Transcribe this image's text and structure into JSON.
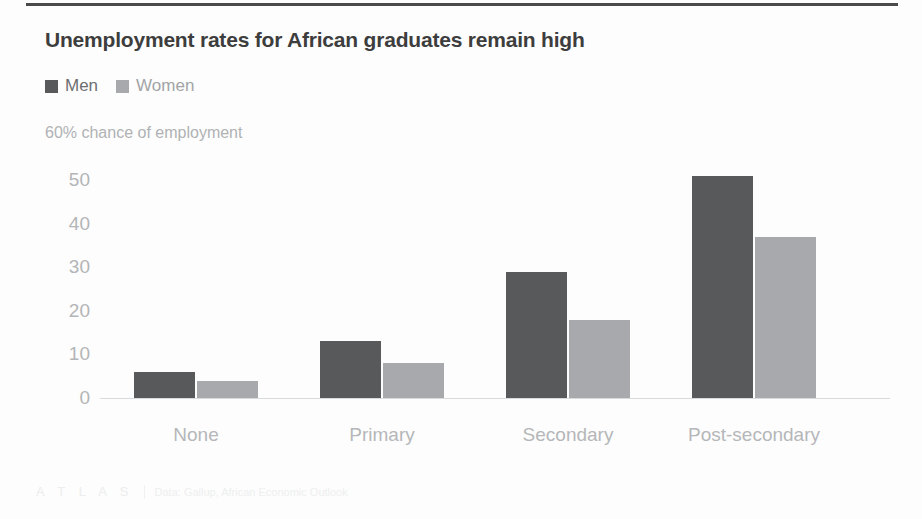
{
  "chart_data": {
    "type": "bar",
    "title": "Unemployment rates for African graduates remain high",
    "subtitle": "60% chance of employment",
    "categories": [
      "None",
      "Primary",
      "Secondary",
      "Post-secondary"
    ],
    "series": [
      {
        "name": "Men",
        "color": "#58595b",
        "values": [
          6,
          13,
          29,
          51
        ]
      },
      {
        "name": "Women",
        "color": "#a7a9ac",
        "values": [
          4,
          8,
          18,
          37
        ]
      }
    ],
    "xlabel": "",
    "ylabel": "",
    "ylim": [
      0,
      55
    ],
    "yticks": [
      0,
      10,
      20,
      30,
      40,
      50
    ],
    "ytick_labels": [
      "0",
      "10",
      "20",
      "30",
      "40",
      "50"
    ],
    "grid": false,
    "legend_position": "top-left",
    "source": "Data: Gallup, African Economic Outlook",
    "brand": "ATLAS"
  },
  "header": {
    "title": "Unemployment rates for African graduates remain high",
    "subtitle": "60% chance of employment"
  },
  "legend": {
    "items": [
      {
        "label": "Men",
        "swatch": "men-swatch-icon"
      },
      {
        "label": "Women",
        "swatch": "women-swatch-icon"
      }
    ]
  },
  "footer": {
    "brand": "A T L A S",
    "source": "Data: Gallup, African Economic Outlook"
  }
}
